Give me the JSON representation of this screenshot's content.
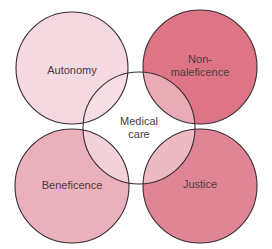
{
  "diagram": {
    "type": "venn",
    "center": {
      "label_line1": "Medical",
      "label_line2": "care",
      "fill": "#ffffff"
    },
    "principles": [
      {
        "id": "autonomy",
        "label": "Autonomy",
        "fill": "#f5d9e1"
      },
      {
        "id": "non-maleficence",
        "label_line1": "Non-",
        "label_line2": "maleficence",
        "fill": "#dd7586"
      },
      {
        "id": "beneficence",
        "label": "Beneficence",
        "fill": "#eab0bc"
      },
      {
        "id": "justice",
        "label": "Justice",
        "fill": "#e08596"
      }
    ],
    "stroke": "#3a2a2e"
  }
}
